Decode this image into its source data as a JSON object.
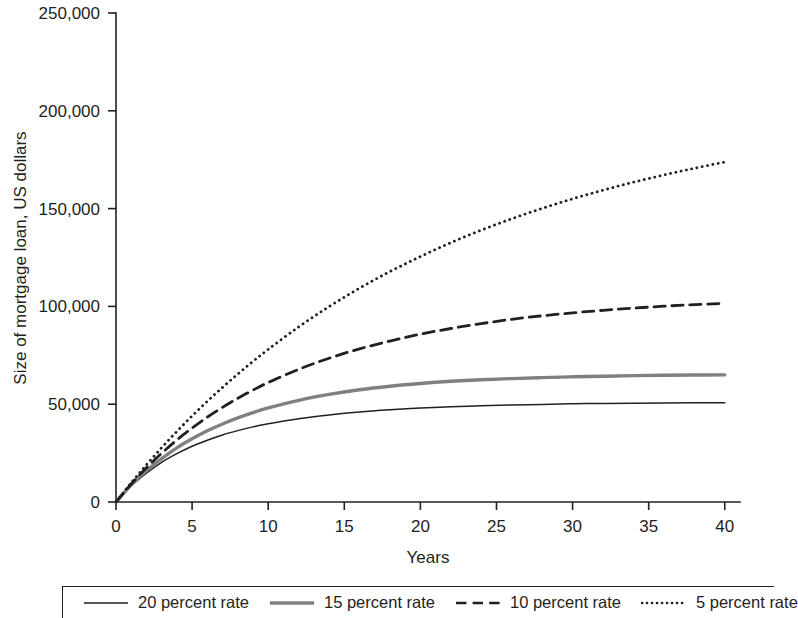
{
  "chart_data": {
    "type": "line",
    "title": "",
    "xlabel": "Years",
    "ylabel": "Size of mortgage loan, US dollars",
    "xlim": [
      0,
      41
    ],
    "ylim": [
      0,
      250000
    ],
    "grid": false,
    "legend_position": "bottom",
    "xticks": [
      0,
      5,
      10,
      15,
      20,
      25,
      30,
      35,
      40
    ],
    "xtick_labels": [
      "0",
      "5",
      "10",
      "15",
      "20",
      "25",
      "30",
      "35",
      "40"
    ],
    "yticks": [
      0,
      50000,
      100000,
      150000,
      200000,
      250000
    ],
    "ytick_labels": [
      "0",
      "50,000",
      "100,000",
      "150,000",
      "200,000",
      "250,000"
    ],
    "x": [
      0,
      1,
      2,
      3,
      4,
      5,
      6,
      7,
      8,
      9,
      10,
      12,
      14,
      16,
      18,
      20,
      22,
      24,
      26,
      28,
      30,
      32,
      34,
      36,
      38,
      40
    ],
    "series": [
      {
        "name": "20 percent rate",
        "style": "solid",
        "color": "#231f20",
        "width": 1.5,
        "values": [
          0,
          8300,
          14800,
          20300,
          24700,
          28500,
          31600,
          34300,
          36500,
          38400,
          40000,
          42600,
          44500,
          46000,
          47100,
          48000,
          48700,
          49200,
          49600,
          49900,
          50200,
          50400,
          50500,
          50600,
          50700,
          50800
        ]
      },
      {
        "name": "15 percent rate",
        "style": "solid",
        "color": "#808080",
        "width": 3.4,
        "values": [
          0,
          8800,
          16000,
          22200,
          27700,
          32300,
          36400,
          39900,
          43000,
          45700,
          48100,
          52000,
          55000,
          57400,
          59200,
          60600,
          61700,
          62500,
          63100,
          63600,
          64000,
          64300,
          64600,
          64800,
          64900,
          65000
        ]
      },
      {
        "name": "10 percent rate",
        "style": "dashed",
        "color": "#231f20",
        "width": 2.8,
        "values": [
          0,
          9200,
          17500,
          24900,
          31700,
          37800,
          43400,
          48400,
          53000,
          57200,
          61100,
          67800,
          73500,
          78300,
          82300,
          85800,
          88700,
          91200,
          93400,
          95200,
          96700,
          98000,
          99100,
          100100,
          100900,
          101600
        ]
      },
      {
        "name": "5 percent rate",
        "style": "dotted",
        "color": "#231f20",
        "width": 2.8,
        "values": [
          0,
          9800,
          19000,
          27800,
          36100,
          44000,
          51500,
          58600,
          65400,
          71900,
          78000,
          89500,
          99900,
          109300,
          117800,
          125500,
          132600,
          139000,
          144800,
          150100,
          155000,
          159400,
          163500,
          167200,
          170600,
          173800
        ]
      }
    ]
  },
  "legend": {
    "items": [
      {
        "label": "20 percent rate",
        "style": "solid",
        "color": "#231f20",
        "width": 1.5
      },
      {
        "label": "15 percent rate",
        "style": "solid",
        "color": "#808080",
        "width": 3.4
      },
      {
        "label": "10 percent rate",
        "style": "dashed",
        "color": "#231f20",
        "width": 2.6
      },
      {
        "label": "5 percent rate",
        "style": "dotted",
        "color": "#231f20",
        "width": 2.6
      }
    ]
  }
}
